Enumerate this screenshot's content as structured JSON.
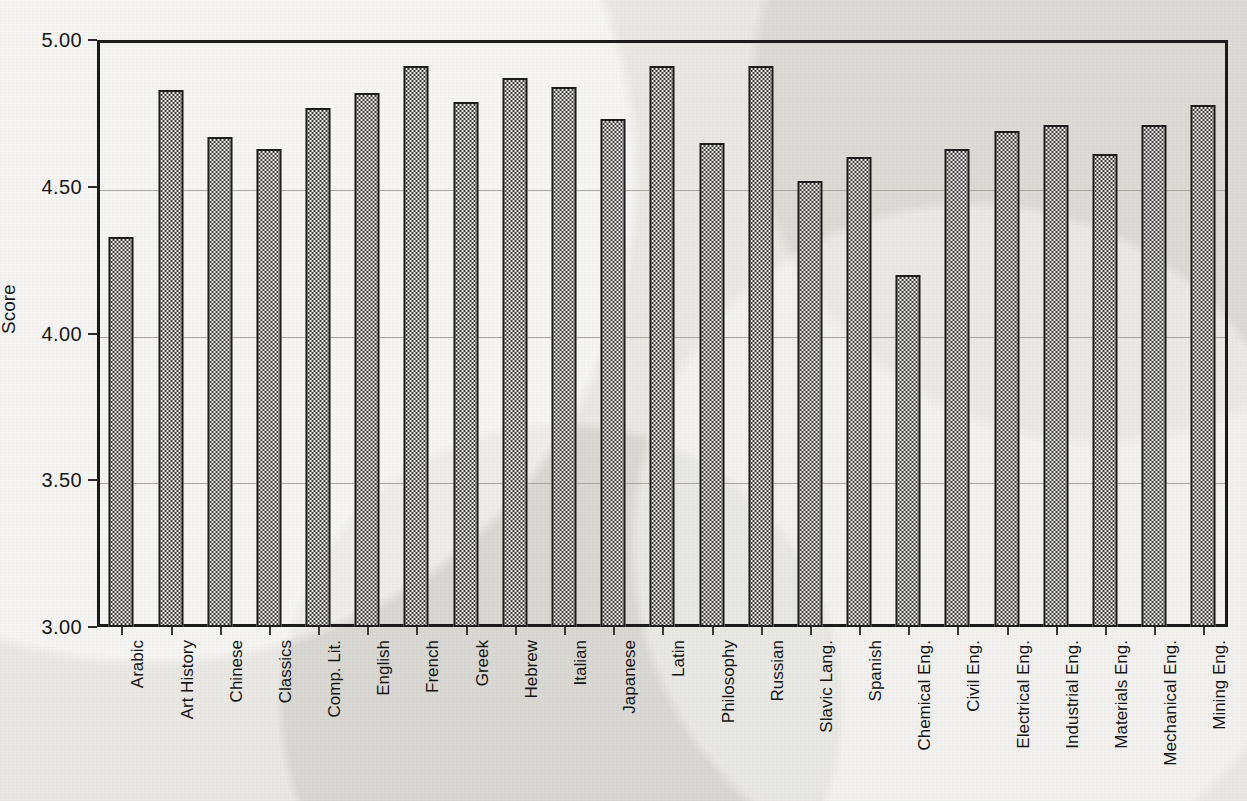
{
  "chart_data": {
    "type": "bar",
    "title": "",
    "xlabel": "",
    "ylabel": "Score",
    "ylim": [
      3.0,
      5.0
    ],
    "ytick_labels": [
      "5.00",
      "4.50",
      "4.00",
      "3.50",
      "3.00"
    ],
    "yticks": [
      5.0,
      4.5,
      4.0,
      3.5,
      3.0
    ],
    "grid": true,
    "legend": "none",
    "categories": [
      "Arabic",
      "Art History",
      "Chinese",
      "Classics",
      "Comp. Lit.",
      "English",
      "French",
      "Greek",
      "Hebrew",
      "Italian",
      "Japanese",
      "Latin",
      "Philosophy",
      "Russian",
      "Slavic Lang.",
      "Spanish",
      "Chemical Eng.",
      "Civil Eng.",
      "Electrical Eng.",
      "Industrial Eng.",
      "Materials Eng.",
      "Mechanical Eng.",
      "Mining Eng."
    ],
    "values": [
      4.33,
      4.83,
      4.67,
      4.63,
      4.77,
      4.82,
      4.91,
      4.79,
      4.87,
      4.84,
      4.73,
      4.91,
      4.65,
      4.91,
      4.52,
      4.6,
      4.2,
      4.63,
      4.69,
      4.71,
      4.61,
      4.71,
      4.78
    ]
  },
  "style": {
    "bar_fill": "#3a3a3a",
    "bar_outline": "#1d1d1d",
    "background": "#e9e8e4",
    "gridline": "#a8a6a0",
    "text": "#141414"
  }
}
